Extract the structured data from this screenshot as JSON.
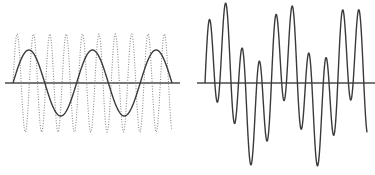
{
  "figure": {
    "colors": {
      "background": "#ffffff",
      "axis": "#4a4a4a",
      "slow_wave": "#3a3a3a",
      "fast_wave": "#8a8a8a",
      "sum_wave": "#3a3a3a"
    }
  },
  "left_panel": {
    "axis": {
      "x1": 5,
      "x2": 180,
      "y": 83
    },
    "x_start": 13,
    "x_end": 172,
    "waves": [
      {
        "name": "slow-sine",
        "style": "solid",
        "amplitude": 33,
        "period": 63.6
      },
      {
        "name": "fast-sine",
        "style": "dotted",
        "amplitude": 49,
        "period": 16.37
      }
    ]
  },
  "right_panel": {
    "axis": {
      "x1": 197,
      "x2": 375,
      "y": 83
    },
    "x_start": 205,
    "x_end": 367,
    "waves": [
      {
        "name": "sum",
        "style": "solid",
        "components": [
          {
            "amplitude": 33,
            "period": 64.8
          },
          {
            "amplitude": 50,
            "period": 16.66
          }
        ]
      }
    ]
  }
}
